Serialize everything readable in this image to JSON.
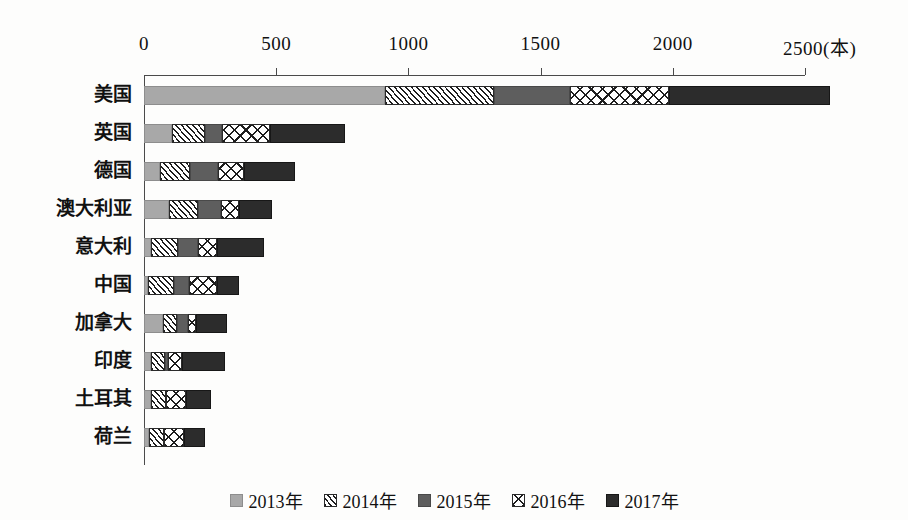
{
  "chart_data": {
    "type": "bar",
    "orientation": "horizontal",
    "stacked": true,
    "title": "",
    "xlabel": "(本)",
    "ylabel": "",
    "xlim": [
      0,
      2500
    ],
    "xticks": [
      0,
      500,
      1000,
      1500,
      2000,
      2500
    ],
    "xtick_labels": [
      "0",
      "500",
      "1000",
      "1500",
      "2000",
      "2500(本)"
    ],
    "grid": false,
    "legend_position": "bottom",
    "categories": [
      "美国",
      "英国",
      "德国",
      "澳大利亚",
      "意大利",
      "中国",
      "加拿大",
      "印度",
      "土耳其",
      "荷兰"
    ],
    "series": [
      {
        "name": "2013年",
        "pattern": "solid-light-gray",
        "color": "#a8a8a8",
        "values": [
          910,
          105,
          60,
          95,
          25,
          15,
          70,
          25,
          25,
          20
        ]
      },
      {
        "name": "2014年",
        "pattern": "diagonal-hatch",
        "color": "#ffffff",
        "values": [
          415,
          125,
          115,
          110,
          105,
          100,
          55,
          55,
          60,
          55
        ]
      },
      {
        "name": "2015年",
        "pattern": "solid-medium-gray",
        "color": "#5e5e5e",
        "values": [
          285,
          65,
          105,
          85,
          75,
          55,
          40,
          10,
          0,
          0
        ]
      },
      {
        "name": "2016年",
        "pattern": "cross-hatch",
        "color": "#ffffff",
        "values": [
          375,
          180,
          100,
          70,
          70,
          105,
          30,
          55,
          75,
          75
        ]
      },
      {
        "name": "2017年",
        "pattern": "solid-dark",
        "color": "#2c2c2c",
        "values": [
          610,
          285,
          190,
          125,
          180,
          85,
          120,
          160,
          95,
          80
        ]
      }
    ],
    "totals": [
      2595,
      760,
      570,
      485,
      455,
      360,
      315,
      305,
      255,
      230
    ]
  },
  "legend": {
    "items": [
      {
        "label": "2013年",
        "pattern": "solid-light-gray"
      },
      {
        "label": "2014年",
        "pattern": "diagonal-hatch"
      },
      {
        "label": "2015年",
        "pattern": "solid-medium-gray"
      },
      {
        "label": "2016年",
        "pattern": "cross-hatch"
      },
      {
        "label": "2017年",
        "pattern": "solid-dark"
      }
    ]
  }
}
